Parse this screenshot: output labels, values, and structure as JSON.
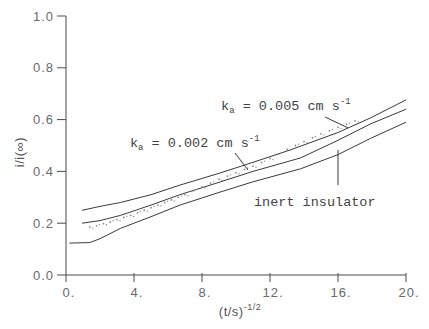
{
  "chart_data": {
    "type": "line",
    "title": "",
    "xlabel": "(t/s)",
    "xlabel_superscript": "-1/2",
    "ylabel": "i/i(∞)",
    "xlim": [
      0,
      20
    ],
    "ylim": [
      0,
      1.0
    ],
    "grid": false,
    "legend": "none (inline annotations)",
    "x_ticks": [
      0,
      4,
      8,
      12,
      16,
      20
    ],
    "x_tick_labels": [
      "0.",
      "4.",
      "8.",
      "12.",
      "16.",
      "20."
    ],
    "y_ticks": [
      0.0,
      0.2,
      0.4,
      0.6,
      0.8,
      1.0
    ],
    "y_tick_labels": [
      "0.0",
      "0.2",
      "0.4",
      "0.6",
      "0.8",
      "1.0"
    ],
    "series": [
      {
        "name": "k_a = 0.005 cm s^-1",
        "style": "solid",
        "points": [
          [
            0.94,
            0.25
          ],
          [
            2,
            0.265
          ],
          [
            3.2,
            0.28
          ],
          [
            5,
            0.31
          ],
          [
            6.7,
            0.347
          ],
          [
            9.06,
            0.394
          ],
          [
            11,
            0.435
          ],
          [
            13.2,
            0.483
          ],
          [
            16,
            0.55
          ],
          [
            17.9,
            0.606
          ],
          [
            20,
            0.676
          ]
        ]
      },
      {
        "name": "k_a = 0.002 cm s^-1",
        "style": "solid",
        "points": [
          [
            0.94,
            0.2
          ],
          [
            2,
            0.21
          ],
          [
            3.2,
            0.23
          ],
          [
            5,
            0.27
          ],
          [
            6.7,
            0.31
          ],
          [
            9.06,
            0.359
          ],
          [
            11,
            0.4
          ],
          [
            13.8,
            0.452
          ],
          [
            16,
            0.52
          ],
          [
            17.9,
            0.583
          ],
          [
            20,
            0.64
          ]
        ]
      },
      {
        "name": "inert insulator",
        "style": "solid",
        "points": [
          [
            0.2,
            0.123
          ],
          [
            1.4,
            0.125
          ],
          [
            2,
            0.14
          ],
          [
            3.2,
            0.18
          ],
          [
            5,
            0.225
          ],
          [
            6.7,
            0.27
          ],
          [
            9.06,
            0.32
          ],
          [
            11,
            0.36
          ],
          [
            13.8,
            0.41
          ],
          [
            16,
            0.465
          ],
          [
            17.9,
            0.527
          ],
          [
            20,
            0.59
          ]
        ]
      },
      {
        "name": "experimental data",
        "style": "dots",
        "points": [
          [
            1.4,
            0.185
          ],
          [
            1.8,
            0.19
          ],
          [
            2.2,
            0.198
          ],
          [
            2.6,
            0.205
          ],
          [
            3,
            0.214
          ],
          [
            3.4,
            0.222
          ],
          [
            3.8,
            0.23
          ],
          [
            4.2,
            0.24
          ],
          [
            4.6,
            0.25
          ],
          [
            5,
            0.26
          ],
          [
            5.4,
            0.27
          ],
          [
            5.8,
            0.28
          ],
          [
            6.2,
            0.29
          ],
          [
            6.6,
            0.3
          ],
          [
            7,
            0.31
          ],
          [
            7.5,
            0.325
          ],
          [
            8,
            0.34
          ],
          [
            8.5,
            0.355
          ],
          [
            9,
            0.37
          ],
          [
            9.5,
            0.382
          ],
          [
            10,
            0.395
          ],
          [
            10.5,
            0.408
          ],
          [
            11,
            0.42
          ],
          [
            11.5,
            0.435
          ],
          [
            12,
            0.45
          ],
          [
            12.5,
            0.467
          ],
          [
            13,
            0.485
          ],
          [
            13.5,
            0.5
          ],
          [
            14,
            0.515
          ],
          [
            14.5,
            0.53
          ],
          [
            15,
            0.545
          ],
          [
            15.5,
            0.557
          ],
          [
            16,
            0.57
          ],
          [
            16.5,
            0.582
          ],
          [
            17,
            0.595
          ]
        ]
      }
    ],
    "annotations": [
      {
        "id": "ka-0005",
        "symbol": "k",
        "sub": "a",
        "text": " = 0.005 cm s",
        "sup": "-1",
        "at": [
          9.12,
          0.637
        ],
        "leader": [
          [
            15.24,
            0.61
          ],
          [
            16.59,
            0.568
          ]
        ]
      },
      {
        "id": "ka-0002",
        "symbol": "k",
        "sub": "a",
        "text": " = 0.002 cm s",
        "sup": "-1",
        "at": [
          3.76,
          0.494
        ],
        "leader": [
          [
            9.94,
            0.471
          ],
          [
            10.71,
            0.405
          ]
        ]
      },
      {
        "id": "inert-insulator",
        "symbol": "",
        "sub": "",
        "text": "inert insulator",
        "sup": "",
        "at": [
          11.06,
          0.266
        ],
        "leader": [
          [
            16.0,
            0.483
          ],
          [
            16.0,
            0.347
          ]
        ]
      }
    ],
    "colors": {
      "line": "#3a3a3a",
      "axis": "#4a4a4a",
      "text": "#555555",
      "dots": "#8a8a8a"
    }
  }
}
